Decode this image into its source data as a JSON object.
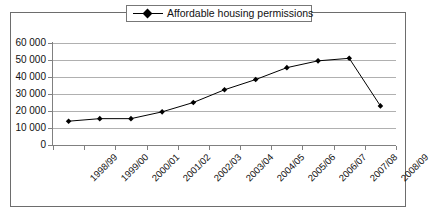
{
  "chart_data": {
    "type": "line",
    "title": "",
    "subtitle": "",
    "xlabel": "",
    "ylabel": "",
    "categories": [
      "1998/99",
      "1999/00",
      "2000/01",
      "2001/02",
      "2002/03",
      "2003/04",
      "2004/05",
      "2005/06",
      "2006/07",
      "2007/08",
      "2008/09"
    ],
    "series": [
      {
        "name": "Affordable housing permissions",
        "values": [
          14000,
          15500,
          15500,
          19500,
          25000,
          32500,
          38500,
          45500,
          49500,
          51000,
          23000
        ],
        "marker": "diamond",
        "line_color": "#000000",
        "marker_color": "#000000"
      }
    ],
    "ylim": [
      0,
      60000
    ],
    "ytick_values": [
      0,
      10000,
      20000,
      30000,
      40000,
      50000,
      60000
    ],
    "ytick_labels": [
      "0",
      "10 000",
      "20 000",
      "30 000",
      "40 000",
      "50 000",
      "60 000"
    ],
    "grid": {
      "horizontal": true,
      "vertical": false,
      "color": "#b0b0b0"
    },
    "legend": {
      "position": "top-center",
      "entries": [
        "Affordable housing permissions"
      ],
      "boxed": true
    },
    "xtick_rotation": -45,
    "plot_border": true,
    "frame_color": "#6d6d6d",
    "background": "#ffffff"
  }
}
